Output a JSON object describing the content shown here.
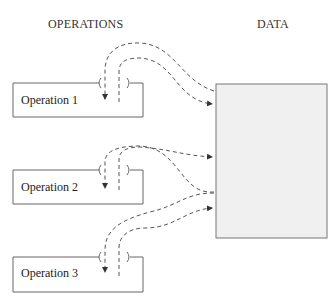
{
  "headers": {
    "operations": "OPERATIONS",
    "data": "DATA"
  },
  "operations": [
    {
      "label": "Operation 1"
    },
    {
      "label": "Operation 2"
    },
    {
      "label": "Operation 3"
    }
  ],
  "data_store": {
    "label": ""
  },
  "colors": {
    "line": "#555555",
    "data_fill": "#f0f0f0",
    "data_stroke": "#777777"
  }
}
